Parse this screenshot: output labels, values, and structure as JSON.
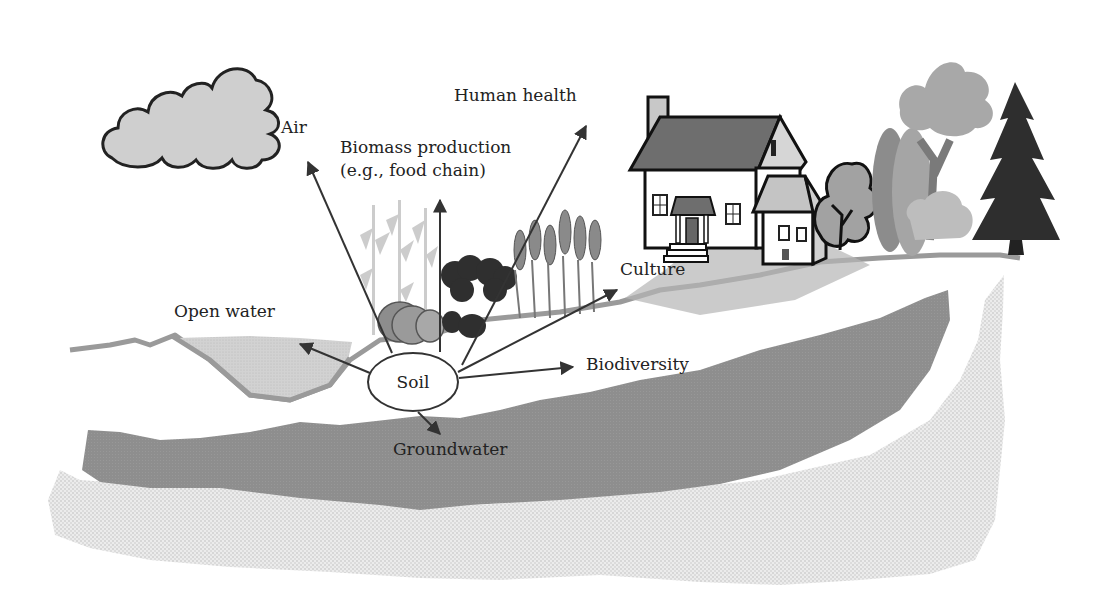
{
  "diagram": {
    "type": "soil-functions-landscape",
    "center_node": {
      "label": "Soil"
    },
    "functions": [
      {
        "id": "air",
        "label": "Air"
      },
      {
        "id": "biomass",
        "label_line1": "Biomass production",
        "label_line2": "(e.g., food chain)"
      },
      {
        "id": "human-health",
        "label": "Human health"
      },
      {
        "id": "culture",
        "label": "Culture"
      },
      {
        "id": "open-water",
        "label": "Open water"
      },
      {
        "id": "biodiversity",
        "label": "Biodiversity"
      },
      {
        "id": "groundwater",
        "label": "Groundwater"
      }
    ],
    "colors": {
      "background": "#ffffff",
      "cloud_fill": "#cfcfcf",
      "ground_line": "#9a9a9a",
      "open_water": "#d4d4d4",
      "groundwater": "#8f8f8f",
      "bedrock": "#e2e2e2",
      "arrow": "#333333",
      "house_roof": "#6e6e6e",
      "conifer": "#2e2e2e"
    }
  }
}
